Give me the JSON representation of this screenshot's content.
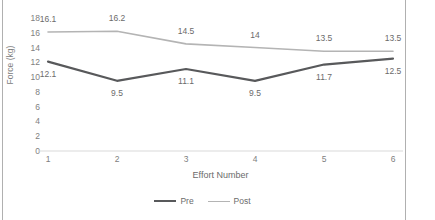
{
  "chart_data": {
    "type": "line",
    "title": "",
    "xlabel": "Effort Number",
    "ylabel": "Force (kg)",
    "categories": [
      "1",
      "2",
      "3",
      "4",
      "5",
      "6"
    ],
    "ylim": [
      0,
      18
    ],
    "yticks": [
      "0",
      "2",
      "4",
      "6",
      "8",
      "10",
      "12",
      "14",
      "16",
      "18"
    ],
    "grid": false,
    "legend_position": "bottom",
    "series": [
      {
        "name": "Pre",
        "color": "#58595b",
        "values": [
          12.1,
          9.5,
          11.1,
          9.5,
          11.7,
          12.5
        ],
        "labels": [
          "12.1",
          "9.5",
          "11.1",
          "9.5",
          "11.7",
          "12.5"
        ],
        "label_side": [
          "below",
          "below",
          "below",
          "below",
          "below",
          "below"
        ]
      },
      {
        "name": "Post",
        "color": "#b4b4b4",
        "values": [
          16.1,
          16.2,
          14.5,
          14.0,
          13.5,
          13.5
        ],
        "labels": [
          "16.1",
          "16.2",
          "14.5",
          "14",
          "13.5",
          "13.5"
        ],
        "label_side": [
          "above",
          "above",
          "above",
          "above",
          "above",
          "above"
        ]
      }
    ]
  },
  "legend": {
    "items": [
      {
        "label": "Pre"
      },
      {
        "label": "Post"
      }
    ]
  },
  "axes": {
    "y_title": "Force (kg)",
    "x_title": "Effort Number"
  },
  "colors": {
    "pre_line": "#58595b",
    "post_line": "#b4b4b4",
    "axis_line": "#d9d9d9",
    "frame_line": "#b0b0b0",
    "text": "#6b6b6b"
  }
}
